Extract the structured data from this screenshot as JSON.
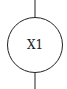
{
  "diagram": {
    "symbol": "circle-component",
    "label": "X1",
    "stroke_color": "#222222",
    "background": "#ffffff"
  }
}
